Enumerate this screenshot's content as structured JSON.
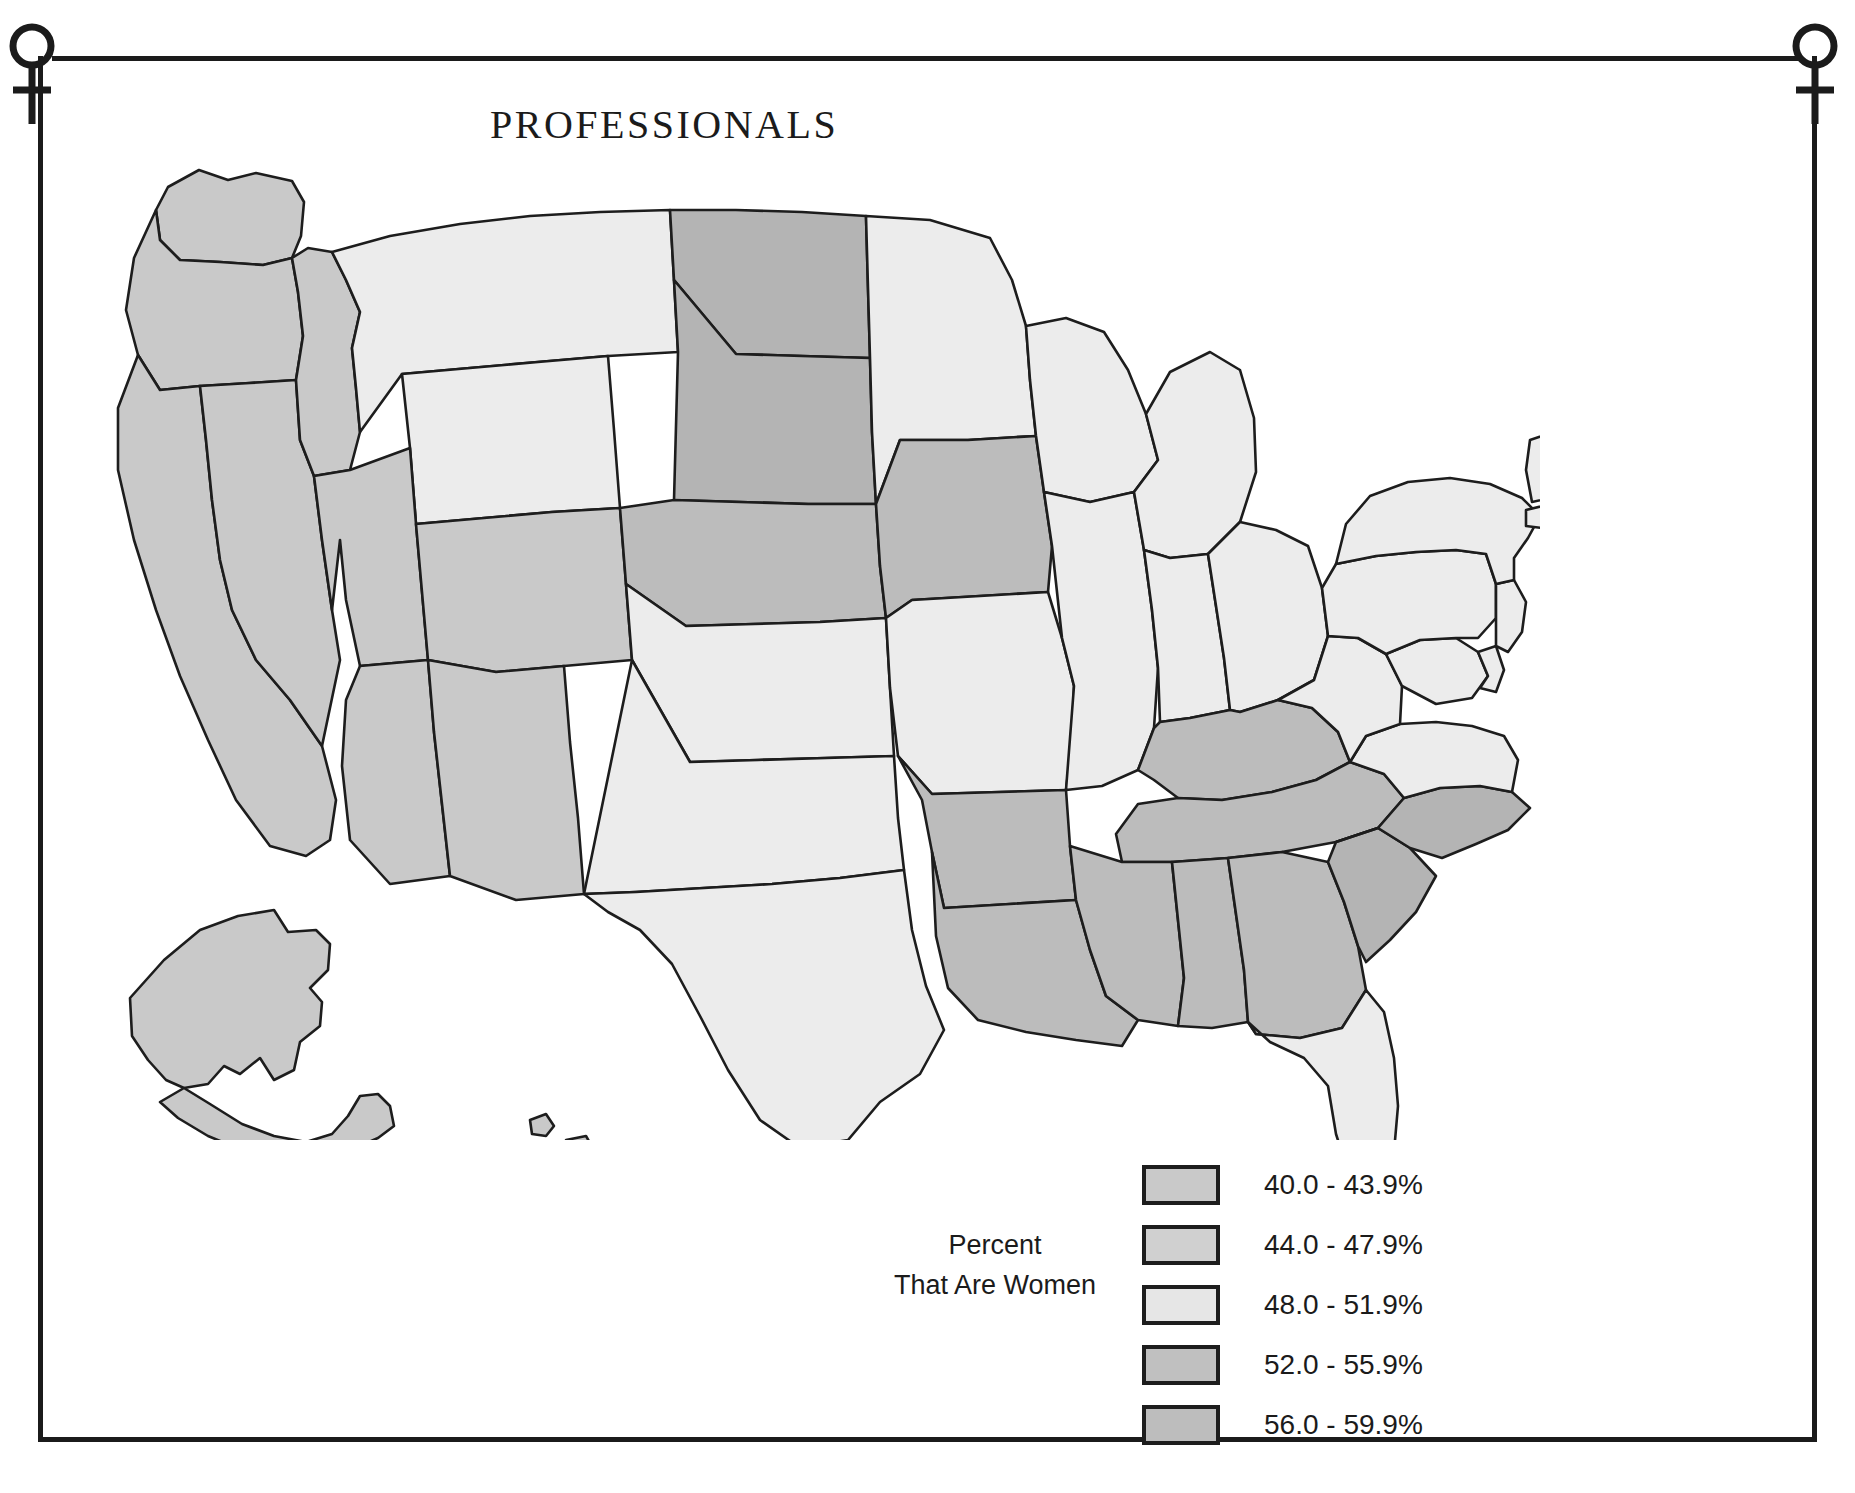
{
  "document": {
    "title": "PROFESSIONALS",
    "frame_symbol_left": "venus-female-symbol",
    "frame_symbol_right": "venus-female-symbol"
  },
  "legend": {
    "title_line1": "Percent",
    "title_line2": "That Are Women",
    "classes": [
      {
        "label": "40.0 - 43.9%",
        "color": "#c9c9c9",
        "min": 40.0,
        "max": 43.9
      },
      {
        "label": "44.0 - 47.9%",
        "color": "#d0d0d0",
        "min": 44.0,
        "max": 47.9
      },
      {
        "label": "48.0 - 51.9%",
        "color": "#e6e6e6",
        "min": 48.0,
        "max": 51.9
      },
      {
        "label": "52.0 - 55.9%",
        "color": "#c0c0c0",
        "min": 52.0,
        "max": 55.9
      },
      {
        "label": "56.0 - 59.9%",
        "color": "#bdbdbd",
        "min": 56.0,
        "max": 59.9
      }
    ]
  },
  "chart_data": {
    "type": "choropleth",
    "title": "PROFESSIONALS",
    "legend_title": "Percent That Are Women",
    "units": "percent",
    "classes": [
      "40.0 - 43.9%",
      "44.0 - 47.9%",
      "48.0 - 51.9%",
      "52.0 - 55.9%",
      "56.0 - 59.9%"
    ],
    "class_colors": [
      "#c9c9c9",
      "#d0d0d0",
      "#e6e6e6",
      "#c0c0c0",
      "#bdbdbd"
    ],
    "regions": [
      {
        "code": "WA",
        "name": "Washington",
        "class": "44.0 - 47.9%",
        "color": "#c9c9c9"
      },
      {
        "code": "OR",
        "name": "Oregon",
        "class": "44.0 - 47.9%",
        "color": "#c9c9c9"
      },
      {
        "code": "CA",
        "name": "California",
        "class": "44.0 - 47.9%",
        "color": "#c9c9c9"
      },
      {
        "code": "NV",
        "name": "Nevada",
        "class": "44.0 - 47.9%",
        "color": "#c9c9c9"
      },
      {
        "code": "ID",
        "name": "Idaho",
        "class": "44.0 - 47.9%",
        "color": "#c9c9c9"
      },
      {
        "code": "MT",
        "name": "Montana",
        "class": "48.0 - 51.9%",
        "color": "#ececec"
      },
      {
        "code": "WY",
        "name": "Wyoming",
        "class": "48.0 - 51.9%",
        "color": "#ececec"
      },
      {
        "code": "UT",
        "name": "Utah",
        "class": "44.0 - 47.9%",
        "color": "#c9c9c9"
      },
      {
        "code": "AZ",
        "name": "Arizona",
        "class": "44.0 - 47.9%",
        "color": "#c9c9c9"
      },
      {
        "code": "CO",
        "name": "Colorado",
        "class": "44.0 - 47.9%",
        "color": "#c9c9c9"
      },
      {
        "code": "NM",
        "name": "New Mexico",
        "class": "44.0 - 47.9%",
        "color": "#c9c9c9"
      },
      {
        "code": "ND",
        "name": "North Dakota",
        "class": "56.0 - 59.9%",
        "color": "#b4b4b4"
      },
      {
        "code": "SD",
        "name": "South Dakota",
        "class": "56.0 - 59.9%",
        "color": "#b4b4b4"
      },
      {
        "code": "NE",
        "name": "Nebraska",
        "class": "52.0 - 55.9%",
        "color": "#bcbcbc"
      },
      {
        "code": "KS",
        "name": "Kansas",
        "class": "48.0 - 51.9%",
        "color": "#ececec"
      },
      {
        "code": "OK",
        "name": "Oklahoma",
        "class": "48.0 - 51.9%",
        "color": "#ececec"
      },
      {
        "code": "TX",
        "name": "Texas",
        "class": "48.0 - 51.9%",
        "color": "#ececec"
      },
      {
        "code": "MN",
        "name": "Minnesota",
        "class": "48.0 - 51.9%",
        "color": "#ececec"
      },
      {
        "code": "IA",
        "name": "Iowa",
        "class": "52.0 - 55.9%",
        "color": "#bcbcbc"
      },
      {
        "code": "MO",
        "name": "Missouri",
        "class": "48.0 - 51.9%",
        "color": "#ececec"
      },
      {
        "code": "AR",
        "name": "Arkansas",
        "class": "52.0 - 55.9%",
        "color": "#bcbcbc"
      },
      {
        "code": "LA",
        "name": "Louisiana",
        "class": "52.0 - 55.9%",
        "color": "#bcbcbc"
      },
      {
        "code": "WI",
        "name": "Wisconsin",
        "class": "48.0 - 51.9%",
        "color": "#ececec"
      },
      {
        "code": "IL",
        "name": "Illinois",
        "class": "48.0 - 51.9%",
        "color": "#ececec"
      },
      {
        "code": "MI",
        "name": "Michigan",
        "class": "48.0 - 51.9%",
        "color": "#ececec"
      },
      {
        "code": "IN",
        "name": "Indiana",
        "class": "48.0 - 51.9%",
        "color": "#ececec"
      },
      {
        "code": "OH",
        "name": "Ohio",
        "class": "48.0 - 51.9%",
        "color": "#ececec"
      },
      {
        "code": "KY",
        "name": "Kentucky",
        "class": "52.0 - 55.9%",
        "color": "#bcbcbc"
      },
      {
        "code": "TN",
        "name": "Tennessee",
        "class": "52.0 - 55.9%",
        "color": "#bcbcbc"
      },
      {
        "code": "MS",
        "name": "Mississippi",
        "class": "52.0 - 55.9%",
        "color": "#bcbcbc"
      },
      {
        "code": "AL",
        "name": "Alabama",
        "class": "52.0 - 55.9%",
        "color": "#bcbcbc"
      },
      {
        "code": "GA",
        "name": "Georgia",
        "class": "52.0 - 55.9%",
        "color": "#bcbcbc"
      },
      {
        "code": "FL",
        "name": "Florida",
        "class": "48.0 - 51.9%",
        "color": "#ececec"
      },
      {
        "code": "SC",
        "name": "South Carolina",
        "class": "56.0 - 59.9%",
        "color": "#b4b4b4"
      },
      {
        "code": "NC",
        "name": "North Carolina",
        "class": "56.0 - 59.9%",
        "color": "#b4b4b4"
      },
      {
        "code": "VA",
        "name": "Virginia",
        "class": "48.0 - 51.9%",
        "color": "#ececec"
      },
      {
        "code": "WV",
        "name": "West Virginia",
        "class": "48.0 - 51.9%",
        "color": "#ececec"
      },
      {
        "code": "MD",
        "name": "Maryland",
        "class": "48.0 - 51.9%",
        "color": "#ececec"
      },
      {
        "code": "DE",
        "name": "Delaware",
        "class": "48.0 - 51.9%",
        "color": "#ececec"
      },
      {
        "code": "PA",
        "name": "Pennsylvania",
        "class": "48.0 - 51.9%",
        "color": "#ececec"
      },
      {
        "code": "NJ",
        "name": "New Jersey",
        "class": "48.0 - 51.9%",
        "color": "#ececec"
      },
      {
        "code": "NY",
        "name": "New York",
        "class": "48.0 - 51.9%",
        "color": "#ececec"
      },
      {
        "code": "CT",
        "name": "Connecticut",
        "class": "52.0 - 55.9%",
        "color": "#bcbcbc"
      },
      {
        "code": "RI",
        "name": "Rhode Island",
        "class": "48.0 - 51.9%",
        "color": "#ececec"
      },
      {
        "code": "MA",
        "name": "Massachusetts",
        "class": "48.0 - 51.9%",
        "color": "#ececec"
      },
      {
        "code": "VT",
        "name": "Vermont",
        "class": "48.0 - 51.9%",
        "color": "#ececec"
      },
      {
        "code": "NH",
        "name": "New Hampshire",
        "class": "48.0 - 51.9%",
        "color": "#ececec"
      },
      {
        "code": "ME",
        "name": "Maine",
        "class": "52.0 - 55.9%",
        "color": "#bcbcbc"
      },
      {
        "code": "AK",
        "name": "Alaska",
        "class": "44.0 - 47.9%",
        "color": "#c9c9c9"
      },
      {
        "code": "HI",
        "name": "Hawaii",
        "class": "44.0 - 47.9%",
        "color": "#c9c9c9"
      }
    ]
  }
}
